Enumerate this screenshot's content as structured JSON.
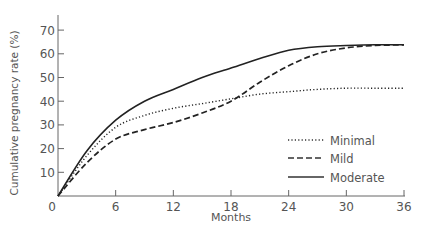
{
  "chart_data": {
    "type": "line",
    "title": "",
    "xlabel": "Months",
    "ylabel": "Cumulative pregnancy rate (%)",
    "xlim": [
      0,
      36
    ],
    "ylim": [
      0,
      75
    ],
    "xticks": [
      0,
      6,
      12,
      18,
      24,
      30,
      36
    ],
    "yticks": [
      10,
      20,
      30,
      40,
      50,
      60,
      70
    ],
    "grid": false,
    "legend_position": "lower right",
    "series": [
      {
        "name": "Minimal",
        "style": "dotted",
        "x": [
          0,
          3,
          6,
          9,
          12,
          15,
          18,
          21,
          24,
          27,
          30,
          33,
          36
        ],
        "y": [
          0,
          17,
          29,
          34,
          37,
          39,
          41,
          43,
          44,
          45,
          45.5,
          45.5,
          45.5
        ]
      },
      {
        "name": "Mild",
        "style": "dashed",
        "x": [
          0,
          3,
          6,
          9,
          12,
          15,
          18,
          21,
          24,
          27,
          30,
          33,
          36
        ],
        "y": [
          0,
          14,
          24,
          28,
          31,
          35,
          40,
          48,
          55,
          60,
          62.5,
          63.5,
          63.8
        ]
      },
      {
        "name": "Moderate",
        "style": "solid",
        "x": [
          0,
          3,
          6,
          9,
          12,
          15,
          18,
          21,
          24,
          27,
          30,
          33,
          36
        ],
        "y": [
          0,
          19,
          32,
          40,
          45,
          50,
          54,
          58,
          61.5,
          63,
          63.5,
          63.8,
          63.8
        ]
      }
    ]
  },
  "labels": {
    "xlabel": "Months",
    "ylabel": "Cumulative pregnancy rate (%)",
    "origin": "0",
    "legend": [
      "Minimal",
      "Mild",
      "Moderate"
    ]
  }
}
